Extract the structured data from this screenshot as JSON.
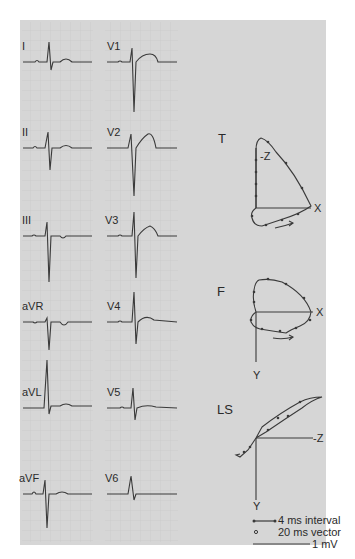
{
  "figure": {
    "background_color": "#d6d6d6",
    "trace_color": "#3a3a3a",
    "grid_color": "#bdbdbd"
  },
  "ecg": {
    "column_left": [
      "I",
      "II",
      "III",
      "aVR",
      "aVL",
      "aVF"
    ],
    "column_right": [
      "V1",
      "V2",
      "V3",
      "V4",
      "V5",
      "V6"
    ]
  },
  "vectorcardiogram": {
    "planes": [
      {
        "name": "T",
        "axes": [
          "-Z",
          "X"
        ]
      },
      {
        "name": "F",
        "axes": [
          "X",
          "Y"
        ]
      },
      {
        "name": "LS",
        "axes": [
          "-Z",
          "Y"
        ]
      }
    ]
  },
  "legend": {
    "interval": "4 ms interval",
    "vector": "20 ms vector",
    "scale": "1 mV"
  }
}
